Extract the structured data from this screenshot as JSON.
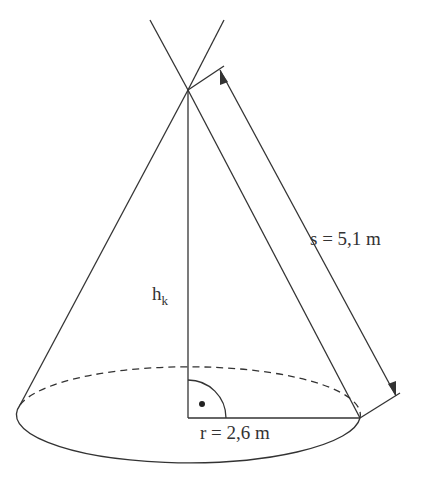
{
  "diagram": {
    "labels": {
      "slant": "s = 5,1 m",
      "height_main": "h",
      "height_sub": "k",
      "radius": "r = 2,6 m"
    },
    "colors": {
      "stroke": "#333333",
      "background": "#ffffff"
    }
  }
}
